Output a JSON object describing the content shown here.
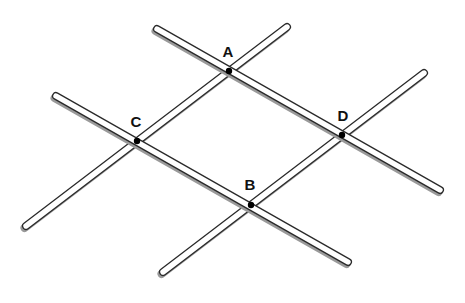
{
  "diagram": {
    "points": [
      {
        "id": "A",
        "label": "A"
      },
      {
        "id": "C",
        "label": "C"
      },
      {
        "id": "D",
        "label": "D"
      },
      {
        "id": "B",
        "label": "B"
      }
    ],
    "rods": [
      {
        "id": "rod-ad",
        "through": [
          "A",
          "D"
        ]
      },
      {
        "id": "rod-cb",
        "through": [
          "C",
          "B"
        ]
      },
      {
        "id": "rod-ca",
        "through": [
          "C",
          "A"
        ]
      },
      {
        "id": "rod-bd",
        "through": [
          "B",
          "D"
        ]
      }
    ],
    "colors": {
      "rod_outline": "#2a2a2a",
      "rod_fill": "#ffffff",
      "shadow": "#9a9a9a",
      "dot": "#000000"
    }
  }
}
